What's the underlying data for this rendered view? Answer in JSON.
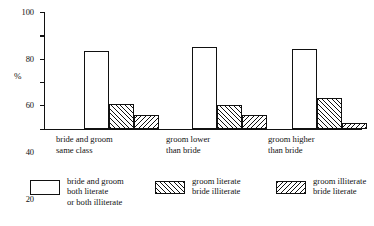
{
  "chart_data": {
    "type": "bar",
    "title": "",
    "subtitle": "",
    "xlabel": "",
    "ylabel": "%",
    "ylim": [
      0,
      100
    ],
    "grid": false,
    "legend_position": "bottom",
    "categories": [
      "bride and groom\nsame class",
      "groom lower\nthan bride",
      "groom higher\nthan bride"
    ],
    "series": [
      {
        "name": "bride and groom\nboth literate\nor both illiterate",
        "pattern": "plain",
        "values": [
          67,
          70,
          68
        ]
      },
      {
        "name": "groom literate\nbride illiterate",
        "pattern": "forward-hatch",
        "values": [
          21,
          20,
          26
        ]
      },
      {
        "name": "groom illiterate\nbride literate",
        "pattern": "backward-hatch",
        "values": [
          12,
          12,
          5
        ]
      }
    ],
    "y_ticks": [
      {
        "value": 100,
        "label": "100"
      },
      {
        "value": 80,
        "label": "80"
      },
      {
        "value": 60,
        "label": "60"
      },
      {
        "value": 40,
        "label": "40"
      },
      {
        "value": 20,
        "label": "20"
      },
      {
        "value": 0,
        "label": "0"
      }
    ]
  },
  "axis": {
    "y_label": "%"
  },
  "legend": {
    "items": [
      {
        "label": "bride and groom\nboth literate\nor both illiterate",
        "pattern": "plain"
      },
      {
        "label": "groom literate\nbride illiterate",
        "pattern": "forward-hatch"
      },
      {
        "label": "groom illiterate\nbride literate",
        "pattern": "backward-hatch"
      }
    ]
  },
  "colors": {
    "ink": "#111111",
    "paper": "#ffffff"
  }
}
